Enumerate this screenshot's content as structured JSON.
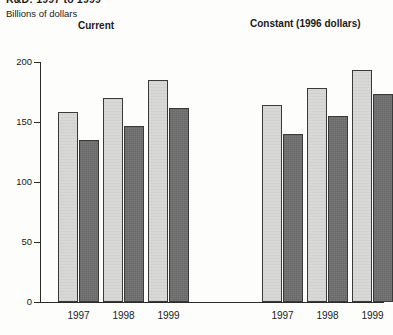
{
  "title": "R&D: 1997 to 1999",
  "axis_caption": "Billions of dollars",
  "groups": {
    "current_label": "Current",
    "constant_label": "Constant (1996 dollars)"
  },
  "y_ticks": [
    "200",
    "150",
    "100",
    "50",
    "0"
  ],
  "x_labels": {
    "g0_1997": "1997",
    "g0_1998": "1998",
    "g0_1999": "1999",
    "g1_1997": "1997",
    "g1_1998": "1998",
    "g1_1999": "1999"
  },
  "colors": {
    "light_bar": "#d8d8d6",
    "dark_bar": "#6f6f6f",
    "axis": "#2b2b2b",
    "background": "#fdfdfc"
  },
  "chart_data": {
    "type": "bar",
    "title": "R&D: 1997 to 1999",
    "xlabel": "",
    "ylabel": "Billions of dollars",
    "ylim": [
      0,
      200
    ],
    "yticks": [
      0,
      50,
      100,
      150,
      200
    ],
    "grid": false,
    "legend": "none",
    "panels": [
      {
        "name": "Current",
        "categories": [
          "1997",
          "1998",
          "1999"
        ],
        "series": [
          {
            "name": "light",
            "values": [
              158,
              170,
              185
            ]
          },
          {
            "name": "dark",
            "values": [
              135,
              147,
              162
            ]
          }
        ]
      },
      {
        "name": "Constant (1996 dollars)",
        "categories": [
          "1997",
          "1998",
          "1999"
        ],
        "series": [
          {
            "name": "light",
            "values": [
              164,
              178,
              193
            ]
          },
          {
            "name": "dark",
            "values": [
              140,
              155,
              173
            ]
          }
        ]
      }
    ]
  }
}
